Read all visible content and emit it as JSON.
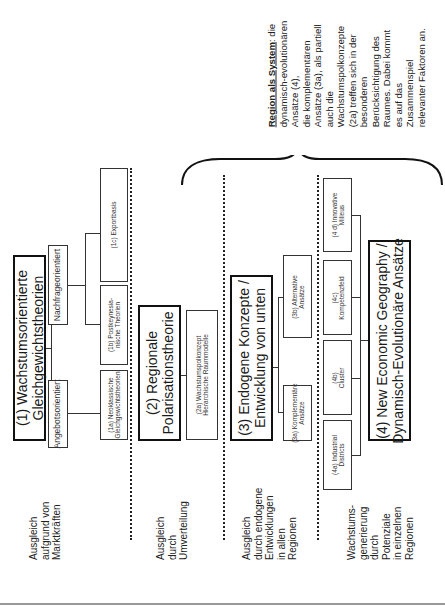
{
  "diagram": {
    "bands": [
      {
        "id": "1",
        "main": "(1) Wachstumsorientierte\nGleichgewichtstheorien",
        "main_line1": "(1) Wachstumsorientierte",
        "main_line2": "Gleichgewichtstheorien",
        "groups": [
          {
            "label": "Angebotsorientiert"
          },
          {
            "label": "Nachfrageorientiert"
          }
        ],
        "subs": [
          {
            "line1": "(1a) Neoklassische",
            "line2": "Gleichgewichtstheorien"
          },
          {
            "line1": "(1b) Postkeynesia-",
            "line2": "nische Theorien"
          },
          {
            "line1": "(1c) Exportbasis",
            "line2": ""
          }
        ],
        "side_label": [
          "Ausgleich",
          "aufgrund von",
          "Marktkräften"
        ]
      },
      {
        "id": "2",
        "main_line1": "(2) Regionale",
        "main_line2": "Polarisationstheorie",
        "subs": [
          {
            "line1": "(2a) Wachstumspolkonzept",
            "line2": "Hierarchische Raummodelle"
          }
        ],
        "side_label": [
          "Ausgleich",
          "durch",
          "Umverteilung"
        ]
      },
      {
        "id": "3",
        "main_line1": "(3) Endogene Konzepte /",
        "main_line2": "Entwicklung von unten",
        "subs": [
          {
            "line1": "(3a) Komplementäre",
            "line2": "Ansätze"
          },
          {
            "line1": "(3b) Alternative",
            "line2": "Ansätze"
          }
        ],
        "side_label": [
          "Ausgleich",
          "durch endogene",
          "Entwicklungen",
          "in allen",
          "Regionen"
        ]
      },
      {
        "id": "4",
        "main_line1": "(4) New Economic Geography /",
        "main_line2": "Dynamisch-Evolutionäre Ansätze",
        "subs": [
          {
            "line1": "(4a) Industrial",
            "line2": "Districts"
          },
          {
            "line1": "(4b)",
            "line2": "Cluster"
          },
          {
            "line1": "(4c)",
            "line2": "Kompetenzfeld"
          },
          {
            "line1": "(4 d) Innovative",
            "line2": "Milieus"
          }
        ],
        "side_label": [
          "Wachstums-",
          "generierung",
          "durch",
          "Potenziale",
          "in einzelnen",
          "Regionen"
        ]
      }
    ],
    "annotation": {
      "title": "Region als System",
      "lines": [
        ": die",
        "dynamisch-evolutionären",
        "Ansätze (4),",
        "die komplementären",
        "Ansätze (3a), als partiell",
        "auch die",
        "Wachstumspolkonzepte",
        "(2a) treffen sich in der",
        "besonderen",
        "Berücksichtigung des",
        "Raumes. Dabei kommt",
        "es auf das",
        "Zusammenspiel",
        "relevanter Faktoren an."
      ]
    }
  }
}
